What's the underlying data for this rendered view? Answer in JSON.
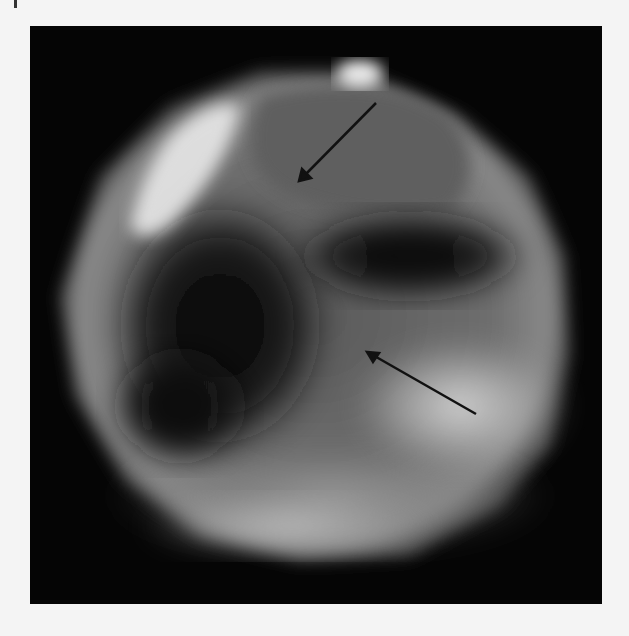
{
  "figure": {
    "panel_mark": "|",
    "background_color": "#f4f4f4",
    "frame_color": "#050505",
    "image_type": "grayscale endoscopic view",
    "annotations": [
      {
        "type": "arrow",
        "color": "#111111",
        "from": [
          376,
          103
        ],
        "to": [
          299,
          181
        ]
      },
      {
        "type": "arrow",
        "color": "#111111",
        "from": [
          476,
          414
        ],
        "to": [
          367,
          352
        ]
      }
    ]
  }
}
